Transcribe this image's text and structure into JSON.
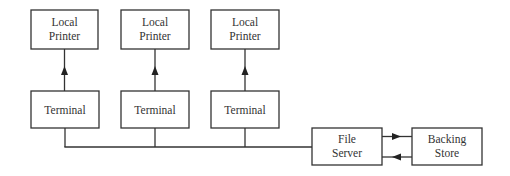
{
  "diagram": {
    "type": "network-topology",
    "colors": {
      "stroke": "#333333",
      "background": "#ffffff"
    },
    "printers": [
      {
        "line1": "Local",
        "line2": "Printer"
      },
      {
        "line1": "Local",
        "line2": "Printer"
      },
      {
        "line1": "Local",
        "line2": "Printer"
      }
    ],
    "terminals": [
      {
        "label": "Terminal"
      },
      {
        "label": "Terminal"
      },
      {
        "label": "Terminal"
      }
    ],
    "file_server": {
      "line1": "File",
      "line2": "Server"
    },
    "backing_store": {
      "line1": "Backing",
      "line2": "Store"
    },
    "edges": [
      {
        "from": "terminal-1",
        "to": "printer-1",
        "arrow": "up"
      },
      {
        "from": "terminal-2",
        "to": "printer-2",
        "arrow": "up"
      },
      {
        "from": "terminal-3",
        "to": "printer-3",
        "arrow": "up"
      },
      {
        "from": "terminals-bus",
        "to": "file-server",
        "arrow": "none"
      },
      {
        "from": "file-server",
        "to": "backing-store",
        "arrow": "right"
      },
      {
        "from": "backing-store",
        "to": "file-server",
        "arrow": "left"
      }
    ]
  }
}
